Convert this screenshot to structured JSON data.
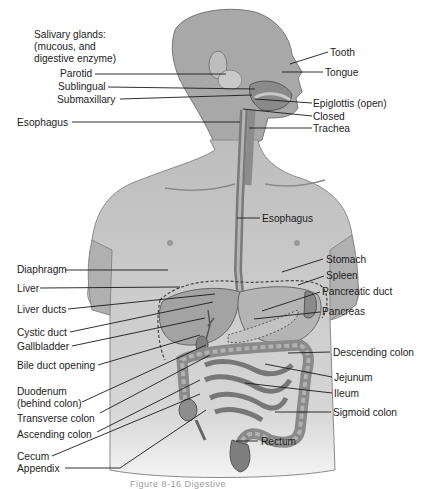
{
  "figure": {
    "title_block": [
      "Salivary glands:",
      "(mucous, and",
      "digestive enzyme)"
    ],
    "caption": "Figure 8-16  Digestive"
  },
  "labels_left": [
    {
      "id": "parotid",
      "text": "Parotid"
    },
    {
      "id": "sublingual",
      "text": "Sublingual"
    },
    {
      "id": "submaxillary",
      "text": "Submaxillary"
    },
    {
      "id": "esophagus-upper",
      "text": "Esophagus"
    },
    {
      "id": "diaphragm",
      "text": "Diaphragm"
    },
    {
      "id": "liver",
      "text": "Liver"
    },
    {
      "id": "liver-ducts",
      "text": "Liver ducts"
    },
    {
      "id": "cystic-duct",
      "text": "Cystic duct"
    },
    {
      "id": "gallbladder",
      "text": "Gallbladder"
    },
    {
      "id": "bile-duct-opening",
      "text": "Bile duct opening"
    },
    {
      "id": "duodenum",
      "text": "Duodenum",
      "sub": "(behind colon)"
    },
    {
      "id": "transverse-colon",
      "text": "Transverse colon"
    },
    {
      "id": "ascending-colon",
      "text": "Ascending colon"
    },
    {
      "id": "cecum",
      "text": "Cecum"
    },
    {
      "id": "appendix",
      "text": "Appendix"
    }
  ],
  "labels_right": [
    {
      "id": "tooth",
      "text": "Tooth"
    },
    {
      "id": "tongue",
      "text": "Tongue"
    },
    {
      "id": "epiglottis",
      "text": "Epiglottis (open)"
    },
    {
      "id": "closed",
      "text": "Closed"
    },
    {
      "id": "trachea",
      "text": "Trachea"
    },
    {
      "id": "esophagus-mid",
      "text": "Esophagus"
    },
    {
      "id": "stomach",
      "text": "Stomach"
    },
    {
      "id": "spleen",
      "text": "Spleen"
    },
    {
      "id": "pancreatic-duct",
      "text": "Pancreatic duct"
    },
    {
      "id": "pancreas",
      "text": "Pancreas"
    },
    {
      "id": "descending-colon",
      "text": "Descending colon"
    },
    {
      "id": "jejunum",
      "text": "Jejunum"
    },
    {
      "id": "ileum",
      "text": "Ileum"
    },
    {
      "id": "sigmoid-colon",
      "text": "Sigmoid colon"
    },
    {
      "id": "rectum",
      "text": "Rectum"
    }
  ],
  "colors": {
    "skin": "#b9b9b9",
    "skin_dark": "#8c8c8c",
    "organ": "#9a9a9a",
    "organ_dark": "#6e6e6e",
    "line": "#1a1a1a"
  }
}
